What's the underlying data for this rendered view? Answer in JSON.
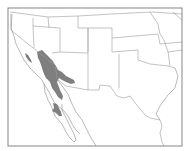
{
  "map": {
    "region": "Southwestern United States and northwestern Mexico",
    "type": "species range map",
    "legend": [],
    "colors": {
      "background": "#ffffff",
      "range_fill": "#7f7f7f",
      "border_stroke": "#9a9a9a",
      "frame_stroke": "#7a7a7a"
    },
    "range_areas": [
      {
        "name": "main-range",
        "description": "Mojave / Sonoran desert region of SE California, S Nevada, W Arizona, NE Baja California"
      },
      {
        "name": "central-valley-patch",
        "description": "small patch in southern San Joaquin Valley, California"
      },
      {
        "name": "baja-patch",
        "description": "patch in central Baja California"
      }
    ]
  }
}
